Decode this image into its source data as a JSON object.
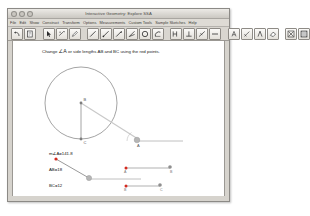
{
  "window": {
    "title": "Interactive Geometry: Explore SSA",
    "traffic_lights": [
      "close-button",
      "minimize-button",
      "zoom-button"
    ]
  },
  "menubar": {
    "items": [
      {
        "label": "File"
      },
      {
        "label": "Edit"
      },
      {
        "label": "Show"
      },
      {
        "label": "Construct"
      },
      {
        "label": "Transform"
      },
      {
        "label": "Options"
      },
      {
        "label": "Measurements"
      },
      {
        "label": "Custom Tools"
      },
      {
        "label": "Sample Sketches"
      },
      {
        "label": "Help"
      }
    ]
  },
  "toolbar": {
    "groups": [
      {
        "buttons": [
          {
            "name": "undo-tool",
            "icon": "undo-arrow-icon"
          },
          {
            "name": "redo-tool",
            "icon": "redo-page-icon"
          }
        ]
      },
      {
        "buttons": [
          {
            "name": "select-arrow-tool",
            "icon": "arrow-pointer-icon"
          },
          {
            "name": "translate-tool",
            "icon": "translate-arrows-icon"
          },
          {
            "name": "marker-tool",
            "icon": "marker-pen-icon"
          }
        ]
      },
      {
        "buttons": [
          {
            "name": "line-tool",
            "icon": "line-segment-icon"
          },
          {
            "name": "ray-tool",
            "icon": "ray-icon"
          },
          {
            "name": "vector-tool",
            "icon": "vector-arrow-icon"
          },
          {
            "name": "polygon-tool",
            "icon": "angle-lines-icon"
          },
          {
            "name": "circle-tool",
            "icon": "circle-icon"
          },
          {
            "name": "arc-tool",
            "icon": "arc-icon"
          }
        ]
      },
      {
        "buttons": [
          {
            "name": "perpendicular-tool",
            "icon": "perpendicular-icon"
          },
          {
            "name": "midpoint-tool",
            "icon": "midpoint-icon"
          },
          {
            "name": "angle-measure-tool",
            "icon": "angle-measure-icon"
          },
          {
            "name": "distance-tool",
            "icon": "distance-icon"
          }
        ]
      },
      {
        "buttons": [
          {
            "name": "text-label-tool",
            "icon": "text-A-icon"
          },
          {
            "name": "annotate-tool",
            "icon": "annotate-icon"
          },
          {
            "name": "compass-tool",
            "icon": "compass-icon"
          },
          {
            "name": "erase-tool",
            "icon": "eraser-icon"
          }
        ]
      },
      {
        "buttons": [
          {
            "name": "close-tool",
            "icon": "close-x-icon"
          },
          {
            "name": "grid-tool",
            "icon": "grid-icon"
          }
        ]
      }
    ]
  },
  "canvas": {
    "prompt_pre": "Change ",
    "prompt_angle": "∠A",
    "prompt_post": " or side lengths AB and BC using the red points.",
    "measurements": [
      {
        "name": "angle-a-measurement",
        "text": "m∠A=141.8"
      },
      {
        "name": "ab-measurement",
        "text": "AB=18"
      },
      {
        "name": "bc-measurement",
        "text": "BC=12"
      }
    ],
    "figure": {
      "circle_label": "B",
      "radius_foot_label": "C",
      "vertex_label": "A",
      "point_labels": [
        "A",
        "B",
        "C"
      ],
      "slider_labels": {
        "ab_left": "A",
        "ab_right": "B",
        "bc_left": "B",
        "bc_right": "C"
      }
    }
  },
  "colors": {
    "red_point": "#d42a1f",
    "circle_stroke": "#9a9a9a",
    "segment_stroke": "#8d8d8d",
    "text": "#111111",
    "window_chrome": "#d6d3cd",
    "canvas_bg": "#ffffff"
  }
}
